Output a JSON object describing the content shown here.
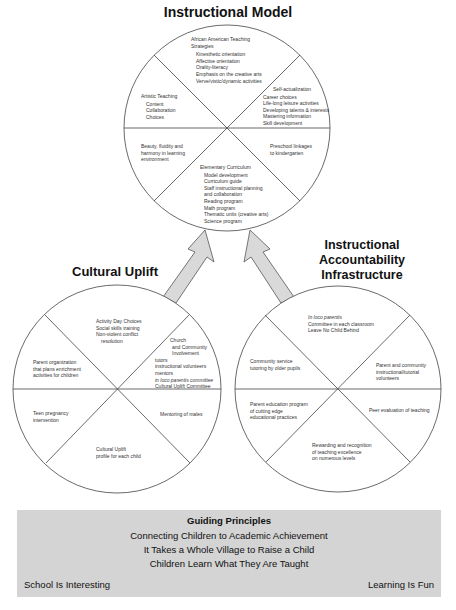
{
  "titles": {
    "instructional_model": "Instructional Model",
    "cultural_uplift": "Cultural Uplift",
    "accountability": [
      "Instructional",
      "Accountability",
      "Infrastructure"
    ]
  },
  "instructional_model": {
    "african_american": {
      "heading": [
        "African American Teaching",
        "Strategies"
      ],
      "items": [
        "Kinesthetic orientation",
        "Affective orientation",
        "Orality-literacy",
        "Emphasis on the creative arts",
        "Verve/vistic/dynamic activities"
      ]
    },
    "artistic": {
      "heading": "Artistic Teaching",
      "items": [
        "Content",
        "Collaboration",
        "Choices"
      ]
    },
    "self_actualization": {
      "heading": "Self-actualization",
      "items": [
        "Career choices",
        "Life-long leisure activities",
        "Developing talents & interests",
        "Mastering information",
        "Skill development"
      ]
    },
    "beauty": [
      "Beauty, fluidity and",
      "harmony in learning",
      "environment"
    ],
    "preschool": [
      "Preschool linkages",
      "to kindergarten"
    ],
    "elementary": {
      "heading": "Elementary Curriculum",
      "items": [
        "Model development",
        "Curriculum guide",
        "Staff instructional planning",
        "and collaboration",
        "Reading program",
        "Math program",
        "Thematic units (creative arts)",
        "Science program"
      ]
    }
  },
  "cultural_uplift": {
    "activity": [
      "Activity Day Choices",
      "Social skills training",
      "Non-violent conflict",
      "resolution"
    ],
    "parent_org": [
      "Parent organization",
      "that plans enrichment",
      "activities for children"
    ],
    "church": {
      "heading": [
        "Church",
        "and Community",
        "Involvement"
      ],
      "items": [
        "tutors",
        "instructional volunteers",
        "mentors",
        "in loco parentis committee",
        "Cultural Uplift Committee"
      ]
    },
    "teen": [
      "Teen pregnancy",
      "intervention"
    ],
    "mentoring": [
      "Mentoring of males"
    ],
    "profile": [
      "Cultural Uplift",
      "profile for each child"
    ]
  },
  "accountability": {
    "in_loco": [
      "In loco parentis",
      "Committee in each classroom",
      "Leave No Child Behind"
    ],
    "community": [
      "Community service",
      "tutoring by older pupils"
    ],
    "parent_community": [
      "Parent and community",
      "instructional/tutorial",
      "volunteers"
    ],
    "parent_education": [
      "Parent education program",
      "of cutting edge",
      "educational practices"
    ],
    "peer": [
      "Peer evaluation of teaching"
    ],
    "rewarding": [
      "Rewarding and recognition",
      "of teaching excellence",
      "on numerous levels"
    ]
  },
  "guiding_principles": {
    "heading": "Guiding Principles",
    "lines": [
      "Connecting Children to Academic Achievement",
      "It Takes a Whole Village to Raise a Child",
      "Children Learn What They Are Taught"
    ],
    "left": "School Is Interesting",
    "right": "Learning Is Fun"
  },
  "colors": {
    "arrow_fill": "#d9d9d9",
    "box_fill": "#d4d4d4",
    "line": "#444444"
  }
}
